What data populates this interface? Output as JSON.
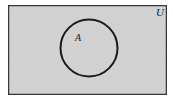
{
  "figure": {
    "kind": "venn-diagram",
    "caption_visible": false,
    "canvas": {
      "width": 174,
      "height": 101
    },
    "background_color": "#ffffff"
  },
  "universal_set": {
    "label": "U",
    "shape": "rectangle",
    "fill_color": "#d3d3d3",
    "stroke_color": "#3a3a3a",
    "stroke_width": 1.4,
    "x": 8,
    "y": 5,
    "width": 159,
    "height": 90,
    "label_x": 160,
    "label_y": 16,
    "label_font_size": 11
  },
  "sets": [
    {
      "label": "A",
      "shape": "circle",
      "fill_color": "none",
      "stroke_color": "#1a1a1a",
      "stroke_width": 2,
      "cx": 89,
      "cy": 48,
      "r": 28.5,
      "label_x": 78,
      "label_y": 41,
      "label_font_size": 10
    }
  ],
  "chart_data": {
    "type": "venn",
    "title": "",
    "universe_label": "U",
    "set_labels": [
      "A"
    ],
    "regions": [
      {
        "name": "A",
        "shaded": false
      },
      {
        "name": "complement-of-A",
        "shaded": true
      }
    ],
    "shading_color": "#d3d3d3"
  }
}
